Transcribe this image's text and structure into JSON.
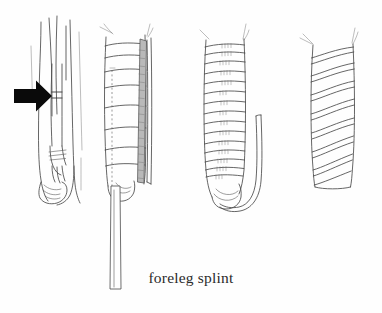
{
  "figure": {
    "caption": "foreleg splint",
    "background_color": "#fefefe",
    "ink_color": "#4a4a4a",
    "arrow_color": "#0a0a0a",
    "rod_color": "#b9b9b9",
    "width": 382,
    "height": 313,
    "panel_count": 4,
    "panels": [
      {
        "index": 1,
        "name": "fractured-foreleg",
        "label": "",
        "description": "Horse foreleg line drawing with solid black arrow indicating the fracture site"
      },
      {
        "index": 2,
        "name": "padded-leg-with-splint-rod",
        "label": "",
        "description": "Foreleg wrapped in padding with a long stippled splint rod placed along the lateral side extending below the hoof"
      },
      {
        "index": 3,
        "name": "horizontally-bandaged-leg",
        "label": "",
        "description": "Foreleg secured with horizontal bandage turns and a curved rod hooking beneath the hoof"
      },
      {
        "index": 4,
        "name": "spiral-bandaged-leg",
        "label": "",
        "description": "Foreleg finished with a spiral bandage wrap"
      }
    ]
  }
}
